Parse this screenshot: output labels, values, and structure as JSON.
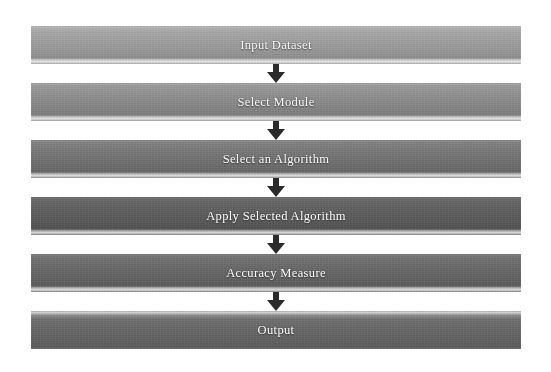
{
  "diagram": {
    "type": "flowchart",
    "orientation": "vertical-top-to-bottom",
    "background_color": "#ffffff",
    "label_color": "#fdfdfd",
    "arrow_color": "#2b2b2b",
    "steps": [
      {
        "id": "step-1",
        "label": "Input Dataset",
        "order": 1,
        "shape": "rectangle-bar",
        "fill_style": "gray-gradient",
        "fill_color": "#9e9e9e"
      },
      {
        "id": "step-2",
        "label": "Select Module",
        "order": 2,
        "shape": "rectangle-bar",
        "fill_style": "gray-gradient",
        "fill_color": "#8c8c8c"
      },
      {
        "id": "step-3",
        "label": "Select an Algorithm",
        "order": 3,
        "shape": "rectangle-bar",
        "fill_style": "gray-gradient",
        "fill_color": "#747474"
      },
      {
        "id": "step-4",
        "label": "Apply Selected Algorithm",
        "order": 4,
        "shape": "rectangle-bar",
        "fill_style": "gray-gradient",
        "fill_color": "#5d5d5d"
      },
      {
        "id": "step-5",
        "label": "Accuracy Measure",
        "order": 5,
        "shape": "rectangle-bar",
        "fill_style": "gray-gradient",
        "fill_color": "#676767"
      },
      {
        "id": "step-6",
        "label": "Output",
        "order": 6,
        "shape": "rectangle-bar",
        "fill_style": "gray-gradient",
        "fill_color": "#636363"
      }
    ],
    "connectors": [
      {
        "id": "arrow-1",
        "from": "step-1",
        "to": "step-2",
        "icon": "arrow-down-icon",
        "label": ""
      },
      {
        "id": "arrow-2",
        "from": "step-2",
        "to": "step-3",
        "icon": "arrow-down-icon",
        "label": ""
      },
      {
        "id": "arrow-3",
        "from": "step-3",
        "to": "step-4",
        "icon": "arrow-down-icon",
        "label": ""
      },
      {
        "id": "arrow-4",
        "from": "step-4",
        "to": "step-5",
        "icon": "arrow-down-icon",
        "label": ""
      },
      {
        "id": "arrow-5",
        "from": "step-5",
        "to": "step-6",
        "icon": "arrow-down-icon",
        "label": ""
      }
    ]
  }
}
